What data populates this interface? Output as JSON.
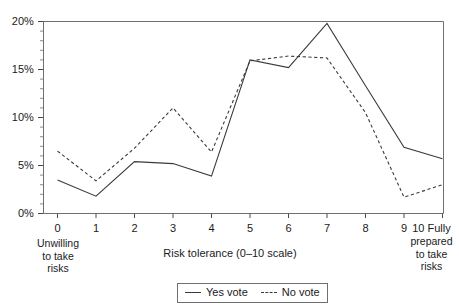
{
  "chart_data": {
    "type": "line",
    "title": "",
    "xlabel": "Risk tolerance (0–10 scale)",
    "ylabel": "",
    "x": [
      0,
      1,
      2,
      3,
      4,
      5,
      6,
      7,
      8,
      9,
      10
    ],
    "categories": [
      "0",
      "1",
      "2",
      "3",
      "4",
      "5",
      "6",
      "7",
      "8",
      "9",
      "10"
    ],
    "series": [
      {
        "name": "Yes vote",
        "style": "solid",
        "color": "#3a3a3a",
        "values": [
          3.5,
          1.8,
          5.4,
          5.2,
          3.9,
          16.0,
          15.2,
          19.8,
          13.3,
          6.9,
          5.7
        ]
      },
      {
        "name": "No vote",
        "style": "dashed",
        "color": "#3a3a3a",
        "values": [
          6.5,
          3.4,
          6.8,
          11.0,
          6.4,
          15.9,
          16.4,
          16.2,
          10.5,
          1.7,
          3.0
        ]
      }
    ],
    "ylim": [
      0,
      20
    ],
    "xlim": [
      0,
      10
    ],
    "yticks": [
      0,
      5,
      10,
      15,
      20
    ],
    "ytick_labels": [
      "0%",
      "5%",
      "10%",
      "15%",
      "20%"
    ],
    "yminor_ticks": [
      1,
      2,
      3,
      4,
      6,
      7,
      8,
      9,
      11,
      12,
      13,
      14,
      16,
      17,
      18,
      19
    ],
    "grid": false,
    "legend_position": "bottom-center"
  },
  "axis": {
    "y_labels": [
      "20%",
      "15%",
      "10%",
      "5%",
      "0%"
    ],
    "x_labels": [
      "0",
      "1",
      "2",
      "3",
      "4",
      "5",
      "6",
      "7",
      "8",
      "9",
      "10"
    ]
  },
  "captions": {
    "left_anchor": "Unwilling\nto take\nrisks",
    "left_anchor_lines": [
      "Unwilling",
      "to take",
      "risks"
    ],
    "right_anchor_lines": [
      "10 Fully",
      "prepared",
      "to take",
      "risks"
    ],
    "right_anchor_tail_lines": [
      "prepared",
      "to take",
      "risks"
    ],
    "right_anchor_head": "10 Fully",
    "xaxis_title": "Risk tolerance (0–10 scale)"
  },
  "legend": {
    "items": [
      {
        "label": "Yes vote",
        "style": "solid"
      },
      {
        "label": "No vote",
        "style": "dashed"
      }
    ]
  }
}
